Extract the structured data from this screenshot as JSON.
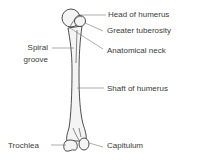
{
  "diagram": {
    "subject": "Humerus",
    "colors": {
      "bone_fill": "#f4f4f4",
      "bone_stroke": "#3a3a3a",
      "leader_line": "#555555",
      "text": "#3a3a3a"
    },
    "labels": {
      "head": "Head of humerus",
      "greater_tuberosity": "Greater tuberosity",
      "anatomical_neck": "Anatomical neck",
      "spiral_groove_1": "Spiral",
      "spiral_groove_2": "groove",
      "shaft": "Shaft of humerus",
      "trochlea": "Trochlea",
      "capitulum": "Capitulum"
    }
  }
}
